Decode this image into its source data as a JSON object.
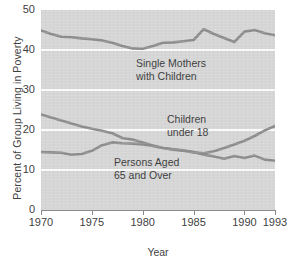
{
  "chart_data": {
    "type": "line",
    "title": "",
    "xlabel": "Year",
    "ylabel": "Percent of Group Living in Poverty",
    "xlim": [
      1970,
      1993
    ],
    "ylim": [
      0,
      50
    ],
    "grid": true,
    "legend_position": "inline-annotations",
    "x": [
      1970,
      1971,
      1972,
      1973,
      1974,
      1975,
      1976,
      1977,
      1978,
      1979,
      1980,
      1981,
      1982,
      1983,
      1984,
      1985,
      1986,
      1987,
      1988,
      1989,
      1990,
      1991,
      1992,
      1993
    ],
    "xticks": [
      1970,
      1975,
      1980,
      1985,
      1990,
      1993
    ],
    "yticks": [
      0,
      10,
      20,
      30,
      40,
      50
    ],
    "series": [
      {
        "name": "Single Mothers with Children",
        "values": [
          44.9,
          44.0,
          43.3,
          43.2,
          42.9,
          42.7,
          42.4,
          41.8,
          41.0,
          40.4,
          40.3,
          41.0,
          41.8,
          41.9,
          42.2,
          42.5,
          45.2,
          44.0,
          43.0,
          42.0,
          44.6,
          45.0,
          44.2,
          43.7
        ]
      },
      {
        "name": "Children under 18",
        "values": [
          23.9,
          23.1,
          22.4,
          21.6,
          20.9,
          20.3,
          19.8,
          19.2,
          18.0,
          17.6,
          16.9,
          16.1,
          15.5,
          15.1,
          14.8,
          14.4,
          14.2,
          14.7,
          15.5,
          16.4,
          17.3,
          18.5,
          19.9,
          21.0
        ]
      },
      {
        "name": "Persons Aged 65 and Over",
        "values": [
          14.5,
          14.4,
          14.3,
          13.8,
          14.0,
          14.8,
          16.2,
          16.9,
          16.7,
          16.6,
          16.4,
          16.0,
          15.5,
          15.2,
          14.9,
          14.5,
          13.8,
          13.4,
          12.8,
          13.5,
          13.0,
          13.6,
          12.6,
          12.3
        ]
      }
    ],
    "annotations": [
      {
        "id": "single",
        "text": "Single Mothers\nwith Children"
      },
      {
        "id": "children",
        "text": "Children\nunder 18"
      },
      {
        "id": "elderly",
        "text": "Persons Aged\n65 and Over"
      }
    ],
    "colors": {
      "line": "#8d8d8d",
      "panel": "#d6d6d6",
      "gridline": "#fbfbfb",
      "text": "#3a3a3a"
    }
  },
  "axes": {
    "y_title": "Percent of Group Living in Poverty",
    "x_title": "Year",
    "y_tick_labels": [
      "50",
      "40",
      "30",
      "20",
      "10",
      "0"
    ],
    "x_tick_labels": [
      "1970",
      "1975",
      "1980",
      "1985",
      "1990",
      "1993"
    ]
  },
  "annotations": {
    "single_mothers": "Single Mothers\nwith Children",
    "children": "Children\nunder 18",
    "elderly": "Persons Aged\n65 and Over"
  }
}
